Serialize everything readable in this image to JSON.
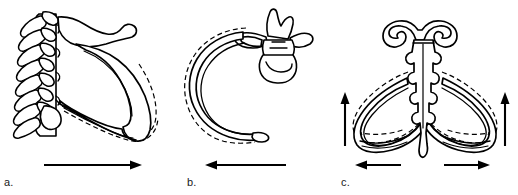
{
  "figure": {
    "width": 518,
    "height": 195,
    "background_color": "#ffffff",
    "line_color": "#000000",
    "type": "anatomical-line-diagram"
  },
  "panels": [
    {
      "id": "a",
      "label": "a.",
      "view": "lateral view of thoracic vertebral column, ribs and sternum",
      "structures": [
        "thoracic vertebrae",
        "spinous processes",
        "ribs",
        "sternum",
        "manubrium"
      ],
      "displacement_outline": "dashed",
      "arrow": {
        "name": "pump-handle-arrow",
        "direction": "right",
        "x_start": 44,
        "x_end": 142,
        "y": 165
      }
    },
    {
      "id": "b",
      "label": "b.",
      "view": "superior view of a single rib with its thoracic vertebra",
      "structures": [
        "thoracic vertebra",
        "spinous process",
        "transverse process",
        "vertebral body",
        "rib shaft",
        "costal cartilage"
      ],
      "displacement_outline": "dashed",
      "arrow": {
        "name": "anterior-displacement-arrow",
        "direction": "left",
        "x_start": 205,
        "x_end": 286,
        "y": 165
      }
    },
    {
      "id": "c",
      "label": "c.",
      "view": "anterior view of sternum with paired ribs",
      "structures": [
        "manubrium",
        "clavicular notch",
        "sternal body",
        "costal notches",
        "xiphoid process",
        "left rib",
        "right rib"
      ],
      "displacement_outline": "dashed",
      "arrows": [
        {
          "name": "left-elevation-arrow",
          "direction": "up",
          "x": 345,
          "y_start": 146,
          "y_end": 92
        },
        {
          "name": "right-elevation-arrow",
          "direction": "up",
          "x": 505,
          "y_start": 146,
          "y_end": 92
        },
        {
          "name": "left-lateral-expansion-arrow",
          "direction": "left",
          "x_start": 355,
          "x_end": 401,
          "y": 165
        },
        {
          "name": "right-lateral-expansion-arrow",
          "direction": "right",
          "x_start": 444,
          "x_end": 490,
          "y": 165
        }
      ]
    }
  ]
}
